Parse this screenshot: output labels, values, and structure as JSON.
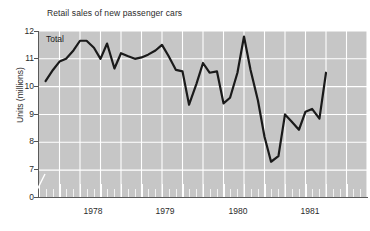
{
  "chart_data": {
    "type": "line",
    "title": "Retail sales of new passenger cars",
    "xlabel": "",
    "ylabel": "Units (millions)",
    "series_label": "Total",
    "ylim": [
      7,
      12
    ],
    "yticks": [
      "12",
      "11",
      "10",
      "9",
      "8",
      "7",
      "0"
    ],
    "ytick_values": [
      12,
      11,
      10,
      9,
      8,
      7,
      0
    ],
    "axis_break": true,
    "xticks": [
      "1978",
      "1979",
      "1980",
      "1981"
    ],
    "xtick_values": [
      1978,
      1979,
      1980,
      1981
    ],
    "xlim": [
      1977.5,
      1981.5
    ],
    "grid": "vertical and horizontal white gridlines",
    "legend_position": "inside top-left",
    "line_color": "#1a1a1a",
    "plot_background": "#c6c6c6",
    "gridline_color": "#ffffff",
    "x": [
      1977.58,
      1977.67,
      1977.75,
      1977.83,
      1977.92,
      1978.0,
      1978.08,
      1978.17,
      1978.25,
      1978.33,
      1978.42,
      1978.5,
      1978.58,
      1978.67,
      1978.75,
      1978.83,
      1978.92,
      1979.0,
      1979.08,
      1979.17,
      1979.25,
      1979.33,
      1979.42,
      1979.5,
      1979.58,
      1979.67,
      1979.75,
      1979.83,
      1979.92,
      1980.0,
      1980.08,
      1980.17,
      1980.25,
      1980.33,
      1980.42,
      1980.5,
      1980.58,
      1980.67,
      1980.75,
      1980.83,
      1980.92,
      1981.0
    ],
    "values": [
      10.2,
      10.6,
      10.9,
      11.0,
      11.3,
      11.65,
      11.65,
      11.4,
      11.0,
      11.55,
      10.65,
      11.2,
      11.1,
      11.0,
      11.05,
      11.15,
      11.3,
      11.5,
      11.1,
      10.6,
      10.55,
      9.35,
      10.1,
      10.85,
      10.5,
      10.55,
      9.4,
      9.6,
      10.5,
      11.8,
      10.6,
      9.5,
      8.2,
      7.3,
      7.5,
      9.0,
      8.75,
      8.45,
      9.1,
      9.2,
      8.85,
      10.5
    ]
  },
  "yticks_layout": [
    {
      "label": "12",
      "top": 27
    },
    {
      "label": "11",
      "top": 54
    },
    {
      "label": "10",
      "top": 82
    },
    {
      "label": "9",
      "top": 110
    },
    {
      "label": "8",
      "top": 137
    },
    {
      "label": "7",
      "top": 165
    },
    {
      "label": "0",
      "top": 193
    }
  ],
  "xticks_layout": [
    {
      "label": "1978",
      "left": 93
    },
    {
      "label": "1979",
      "left": 165
    },
    {
      "label": "1980",
      "left": 238
    },
    {
      "label": "1981",
      "left": 310
    }
  ]
}
